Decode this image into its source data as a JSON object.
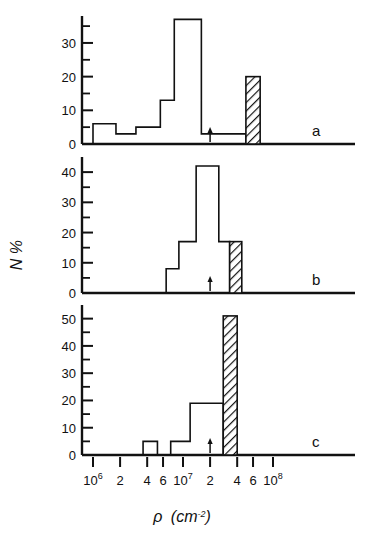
{
  "figure": {
    "y_axis_title": "N %",
    "x_axis_title_symbol": "ρ",
    "x_axis_title_unit": "(cm",
    "x_axis_title_unit_sup": "-2",
    "x_axis_title_unit_close": ")"
  },
  "x_axis": {
    "scale": "log",
    "range": [
      1000000,
      100000000
    ],
    "tick_labels": [
      {
        "value": 1000000,
        "mantissa": "10",
        "exponent": "6"
      },
      {
        "value": 2000000,
        "mantissa": "2",
        "exponent": ""
      },
      {
        "value": 4000000,
        "mantissa": "4",
        "exponent": ""
      },
      {
        "value": 6000000,
        "mantissa": "6",
        "exponent": ""
      },
      {
        "value": 10000000,
        "mantissa": "10",
        "exponent": "7"
      },
      {
        "value": 20000000,
        "mantissa": "2",
        "exponent": ""
      },
      {
        "value": 40000000,
        "mantissa": "4",
        "exponent": ""
      },
      {
        "value": 60000000,
        "mantissa": "6",
        "exponent": ""
      },
      {
        "value": 100000000,
        "mantissa": "10",
        "exponent": "8"
      }
    ]
  },
  "panels": [
    {
      "letter": "a",
      "y_ticks_major": [
        0,
        10,
        20,
        30
      ],
      "y_minor_step": 5,
      "y_max": 38,
      "arrow_x": 20000000,
      "hatched_bar": {
        "x_left": 50000000,
        "x_right": 72000000,
        "value": 20
      },
      "bins": [
        {
          "x_left": 1000000,
          "x_right": 1800000,
          "value": 6
        },
        {
          "x_left": 1800000,
          "x_right": 3000000,
          "value": 3
        },
        {
          "x_left": 3000000,
          "x_right": 5600000,
          "value": 5
        },
        {
          "x_left": 5600000,
          "x_right": 8000000,
          "value": 13
        },
        {
          "x_left": 8000000,
          "x_right": 16000000,
          "value": 37
        },
        {
          "x_left": 16000000,
          "x_right": 50000000,
          "value": 3
        }
      ]
    },
    {
      "letter": "b",
      "y_ticks_major": [
        0,
        10,
        20,
        30,
        40
      ],
      "y_minor_step": 5,
      "y_max": 45,
      "arrow_x": 20000000,
      "hatched_bar": {
        "x_left": 33000000,
        "x_right": 45000000,
        "value": 17
      },
      "bins": [
        {
          "x_left": 6500000,
          "x_right": 9000000,
          "value": 8
        },
        {
          "x_left": 9000000,
          "x_right": 14000000,
          "value": 17
        },
        {
          "x_left": 14000000,
          "x_right": 25000000,
          "value": 42
        },
        {
          "x_left": 25000000,
          "x_right": 33000000,
          "value": 17
        }
      ]
    },
    {
      "letter": "c",
      "y_ticks_major": [
        0,
        10,
        20,
        30,
        40,
        50
      ],
      "y_minor_step": 5,
      "y_max": 55,
      "arrow_x": 20000000,
      "hatched_bar": {
        "x_left": 28000000,
        "x_right": 40000000,
        "value": 51
      },
      "bins": [
        {
          "x_left": 3600000,
          "x_right": 5200000,
          "value": 5
        },
        {
          "x_left": 7300000,
          "x_right": 12000000,
          "value": 5
        },
        {
          "x_left": 12000000,
          "x_right": 28000000,
          "value": 19
        }
      ]
    }
  ],
  "chart_data": {
    "type": "bar",
    "title": "",
    "subtitle": "",
    "xlabel": "ρ (cm-2)",
    "ylabel": "N %",
    "xscale": "log",
    "xlim": [
      1000000,
      100000000
    ],
    "grid": false,
    "legend": null,
    "annotations": [
      {
        "panel": "a",
        "type": "arrow",
        "x": 20000000,
        "note": "marker arrow on baseline"
      },
      {
        "panel": "b",
        "type": "arrow",
        "x": 20000000,
        "note": "marker arrow on baseline"
      },
      {
        "panel": "c",
        "type": "arrow",
        "x": 20000000,
        "note": "marker arrow on baseline"
      },
      {
        "panel": "a",
        "type": "hatched-bar",
        "x_left": 50000000,
        "x_right": 72000000,
        "value": 20
      },
      {
        "panel": "b",
        "type": "hatched-bar",
        "x_left": 33000000,
        "x_right": 45000000,
        "value": 17
      },
      {
        "panel": "c",
        "type": "hatched-bar",
        "x_left": 28000000,
        "x_right": 40000000,
        "value": 51
      }
    ],
    "panels": [
      {
        "name": "a",
        "ylim": [
          0,
          38
        ],
        "yticks": [
          0,
          10,
          20,
          30
        ],
        "bin_edges": [
          1000000,
          1800000,
          3000000,
          5600000,
          8000000,
          16000000,
          50000000
        ],
        "values": [
          6,
          3,
          5,
          13,
          37,
          3
        ],
        "hatched": {
          "bin_edges": [
            50000000,
            72000000
          ],
          "value": 20
        }
      },
      {
        "name": "b",
        "ylim": [
          0,
          45
        ],
        "yticks": [
          0,
          10,
          20,
          30,
          40
        ],
        "bin_edges": [
          6500000,
          9000000,
          14000000,
          25000000,
          33000000
        ],
        "values": [
          8,
          17,
          42,
          17
        ],
        "hatched": {
          "bin_edges": [
            33000000,
            45000000
          ],
          "value": 17
        }
      },
      {
        "name": "c",
        "ylim": [
          0,
          55
        ],
        "yticks": [
          0,
          10,
          20,
          30,
          40,
          50
        ],
        "bin_edges": [
          3600000,
          5200000,
          7300000,
          12000000,
          28000000
        ],
        "values": [
          5,
          null,
          5,
          19
        ],
        "hatched": {
          "bin_edges": [
            28000000,
            40000000
          ],
          "value": 51
        }
      }
    ]
  }
}
